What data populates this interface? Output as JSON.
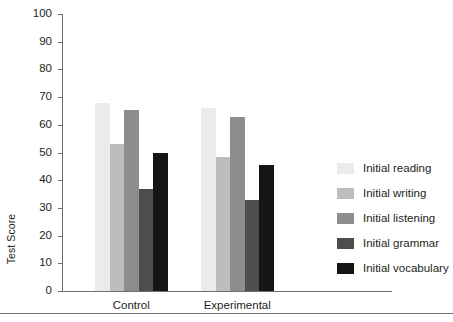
{
  "chart_data": {
    "type": "bar",
    "title": "",
    "xlabel": "",
    "ylabel": "Test Score",
    "ylim": [
      0,
      100
    ],
    "ytick_values": [
      0,
      10,
      20,
      30,
      40,
      50,
      60,
      70,
      80,
      90,
      100
    ],
    "ytick_labels": [
      "0",
      "10",
      "20",
      "30",
      "40",
      "50",
      "60",
      "70",
      "80",
      "90",
      "100"
    ],
    "grid": false,
    "legend_position": "right",
    "categories": [
      "Control",
      "Experimental"
    ],
    "series": [
      {
        "name": "Initial reading",
        "color": "#ebebeb",
        "values": [
          68,
          66
        ]
      },
      {
        "name": "Initial writing",
        "color": "#bdbdbd",
        "values": [
          53,
          48.5
        ]
      },
      {
        "name": "Initial listening",
        "color": "#8d8d8d",
        "values": [
          65.5,
          63
        ]
      },
      {
        "name": "Initial grammar",
        "color": "#4d4d4d",
        "values": [
          37,
          33
        ]
      },
      {
        "name": "Initial vocabulary",
        "color": "#151515",
        "values": [
          50,
          45.5
        ]
      }
    ]
  },
  "axis": {
    "y_label": "Test Score"
  },
  "legend": {
    "items": [
      {
        "label": "Initial reading"
      },
      {
        "label": "Initial writing"
      },
      {
        "label": "Initial listening"
      },
      {
        "label": "Initial grammar"
      },
      {
        "label": "Initial vocabulary"
      }
    ]
  },
  "groups": [
    {
      "label": "Control"
    },
    {
      "label": "Experimental"
    }
  ],
  "colors": {
    "axis": "#6d6e70",
    "text": "#231f20",
    "background": "#ffffff"
  }
}
